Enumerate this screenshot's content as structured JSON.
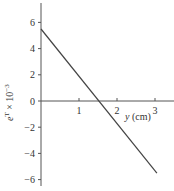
{
  "chart_data": {
    "type": "line",
    "title": "",
    "xlabel": "y (cm)",
    "ylabel": "e^T × 10^-3",
    "xlim": [
      0,
      3.5
    ],
    "ylim": [
      -7,
      7.5
    ],
    "x_ticks": [
      1,
      2,
      3
    ],
    "y_ticks": [
      6,
      4,
      2,
      0,
      -2,
      -4,
      -6
    ],
    "grid": false,
    "legend": null,
    "series": [
      {
        "name": "e^T",
        "x": [
          0,
          3.05
        ],
        "y": [
          5.5,
          -5.5
        ]
      }
    ],
    "annotations": {
      "zero_crossing_x": 1.52
    }
  },
  "labels": {
    "x_axis": "y (cm)",
    "y_axis_base": "e",
    "y_axis_sup": "T",
    "y_axis_mid": " × 10",
    "y_axis_exp": "−3"
  },
  "colors": {
    "axis": "#555555",
    "line": "#444444",
    "text": "#333333"
  }
}
